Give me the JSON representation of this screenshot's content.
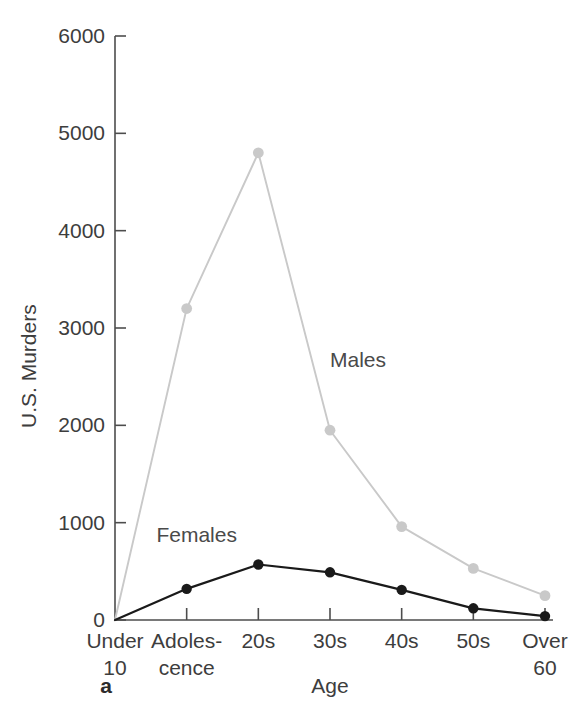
{
  "chart_data": {
    "type": "line",
    "title": "",
    "panel_label": "a",
    "xlabel": "Age",
    "ylabel": "U.S. Murders",
    "categories": [
      "Under\n10",
      "Adoles-\ncence",
      "20s",
      "30s",
      "40s",
      "50s",
      "Over\n60"
    ],
    "category_lines": [
      [
        "Under",
        "10"
      ],
      [
        "Adoles-",
        "cence"
      ],
      [
        "20s",
        ""
      ],
      [
        "30s",
        ""
      ],
      [
        "40s",
        ""
      ],
      [
        "50s",
        ""
      ],
      [
        "Over",
        "60"
      ]
    ],
    "ylim": [
      0,
      6000
    ],
    "yticks": [
      0,
      1000,
      2000,
      3000,
      4000,
      5000,
      6000
    ],
    "ytick_labels": [
      "0",
      "1000",
      "2000",
      "3000",
      "4000",
      "5000",
      "6000"
    ],
    "grid": false,
    "legend_position": "inline-annotation",
    "series": [
      {
        "name": "Males",
        "color": "#c9c9c9",
        "marker": "circle",
        "values": [
          0,
          3200,
          4800,
          1950,
          960,
          530,
          250
        ],
        "label_text": "Males"
      },
      {
        "name": "Females",
        "color": "#1a1a1a",
        "marker": "circle",
        "values": [
          0,
          320,
          570,
          490,
          310,
          120,
          40
        ],
        "label_text": "Females"
      }
    ],
    "annotations": [
      {
        "text": "Males",
        "category": "30s",
        "value": 2600
      },
      {
        "text": "Females",
        "category": "Adoles-cence",
        "value": 800
      }
    ]
  },
  "axis": {
    "y_title": "U.S. Murders",
    "x_title": "Age"
  },
  "figure": {
    "panel_letter": "a"
  }
}
